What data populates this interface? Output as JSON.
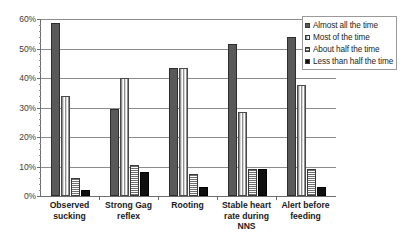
{
  "chart_data": {
    "type": "bar",
    "title": "",
    "xlabel": "",
    "ylabel": "",
    "ylim": [
      0,
      60
    ],
    "ytick_labels": [
      "0%",
      "10%",
      "20%",
      "30%",
      "40%",
      "50%",
      "60%"
    ],
    "ytick_values": [
      0,
      10,
      20,
      30,
      40,
      50,
      60
    ],
    "minor_tick_step": 2,
    "grid": true,
    "legend_position": "top-right",
    "categories": [
      "Observed sucking",
      "Strong Gag reflex",
      "Rooting",
      "Stable heart rate during NNS",
      "Alert before feeding"
    ],
    "category_lines": [
      [
        "Observed",
        "sucking"
      ],
      [
        "Strong Gag",
        "reflex"
      ],
      [
        "Rooting"
      ],
      [
        "Stable heart",
        "rate during",
        "NNS"
      ],
      [
        "Alert before",
        "feeding"
      ]
    ],
    "series": [
      {
        "name": "Almost all the time",
        "color": "#595959",
        "pattern": "solid-dark-gray",
        "values": [
          58.5,
          29.5,
          43.5,
          51.5,
          54.0
        ]
      },
      {
        "name": "Most of the time",
        "color": "#8f8f8f",
        "pattern": "vertical-stripes-light",
        "values": [
          34.0,
          40.0,
          43.5,
          28.5,
          37.5
        ]
      },
      {
        "name": "About half the time",
        "color": "#6e6e6e",
        "pattern": "horizontal-stripes",
        "values": [
          6.0,
          10.5,
          7.5,
          9.0,
          9.0
        ]
      },
      {
        "name": "Less than half the time",
        "color": "#0f0f0f",
        "pattern": "solid-black",
        "values": [
          2.0,
          8.0,
          3.0,
          9.0,
          3.0
        ]
      }
    ]
  }
}
